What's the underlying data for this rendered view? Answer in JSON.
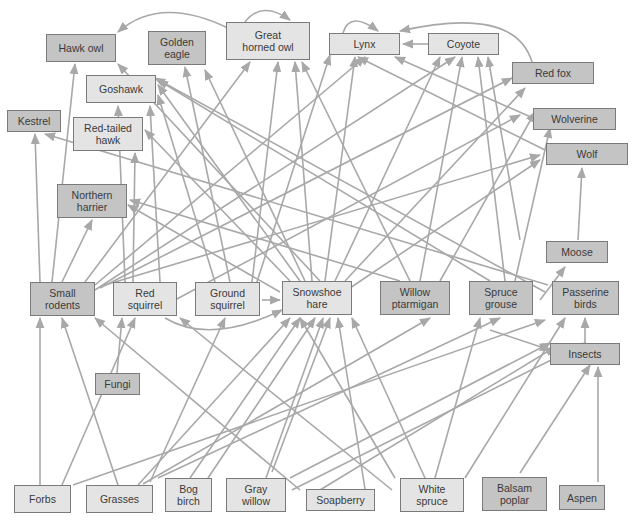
{
  "diagram": {
    "type": "food-web",
    "colors": {
      "light_box": "#e4e4e4",
      "dark_box": "#c4c4c4",
      "border": "#7a7a7a",
      "arrow": "#a8a8a8",
      "text": "#3a3a3a"
    },
    "nodes": [
      {
        "id": "hawk_owl",
        "label": "Hawk owl",
        "x": 46,
        "y": 34,
        "w": 70,
        "h": 28,
        "shade": "dark"
      },
      {
        "id": "golden_eagle",
        "label": "Golden\neagle",
        "x": 148,
        "y": 31,
        "w": 58,
        "h": 34,
        "shade": "dark"
      },
      {
        "id": "great_horned_owl",
        "label": "Great\nhorned owl",
        "x": 226,
        "y": 22,
        "w": 84,
        "h": 38,
        "shade": "light"
      },
      {
        "id": "lynx",
        "label": "Lynx",
        "x": 329,
        "y": 33,
        "w": 71,
        "h": 22,
        "shade": "light"
      },
      {
        "id": "coyote",
        "label": "Coyote",
        "x": 428,
        "y": 33,
        "w": 71,
        "h": 22,
        "shade": "light"
      },
      {
        "id": "red_fox",
        "label": "Red fox",
        "x": 512,
        "y": 62,
        "w": 82,
        "h": 22,
        "shade": "dark"
      },
      {
        "id": "goshawk",
        "label": "Goshawk",
        "x": 86,
        "y": 75,
        "w": 70,
        "h": 28,
        "shade": "light"
      },
      {
        "id": "kestrel",
        "label": "Kestrel",
        "x": 7,
        "y": 110,
        "w": 54,
        "h": 22,
        "shade": "dark"
      },
      {
        "id": "red_tailed_hawk",
        "label": "Red-tailed\nhawk",
        "x": 73,
        "y": 117,
        "w": 70,
        "h": 34,
        "shade": "light"
      },
      {
        "id": "wolverine",
        "label": "Wolverine",
        "x": 533,
        "y": 108,
        "w": 83,
        "h": 22,
        "shade": "dark"
      },
      {
        "id": "wolf",
        "label": "Wolf",
        "x": 546,
        "y": 143,
        "w": 82,
        "h": 22,
        "shade": "dark"
      },
      {
        "id": "northern_harrier",
        "label": "Northern\nharrier",
        "x": 57,
        "y": 184,
        "w": 70,
        "h": 34,
        "shade": "dark"
      },
      {
        "id": "moose",
        "label": "Moose",
        "x": 546,
        "y": 241,
        "w": 62,
        "h": 22,
        "shade": "dark"
      },
      {
        "id": "small_rodents",
        "label": "Small\nrodents",
        "x": 30,
        "y": 282,
        "w": 65,
        "h": 34,
        "shade": "dark"
      },
      {
        "id": "red_squirrel",
        "label": "Red\nsquirrel",
        "x": 113,
        "y": 282,
        "w": 64,
        "h": 34,
        "shade": "light"
      },
      {
        "id": "ground_squirrel",
        "label": "Ground\nsquirrel",
        "x": 195,
        "y": 282,
        "w": 65,
        "h": 34,
        "shade": "light"
      },
      {
        "id": "snowshoe_hare",
        "label": "Snowshoe\nhare",
        "x": 282,
        "y": 281,
        "w": 70,
        "h": 34,
        "shade": "light"
      },
      {
        "id": "willow_ptarmigan",
        "label": "Willow\nptarmigan",
        "x": 380,
        "y": 281,
        "w": 70,
        "h": 34,
        "shade": "dark"
      },
      {
        "id": "spruce_grouse",
        "label": "Spruce\ngrouse",
        "x": 469,
        "y": 281,
        "w": 64,
        "h": 34,
        "shade": "dark"
      },
      {
        "id": "passerine_birds",
        "label": "Passerine\nbirds",
        "x": 552,
        "y": 281,
        "w": 67,
        "h": 34,
        "shade": "dark"
      },
      {
        "id": "insects",
        "label": "Insects",
        "x": 550,
        "y": 343,
        "w": 70,
        "h": 22,
        "shade": "dark"
      },
      {
        "id": "fungi",
        "label": "Fungi",
        "x": 95,
        "y": 373,
        "w": 45,
        "h": 22,
        "shade": "dark"
      },
      {
        "id": "forbs",
        "label": "Forbs",
        "x": 14,
        "y": 485,
        "w": 57,
        "h": 28,
        "shade": "light"
      },
      {
        "id": "grasses",
        "label": "Grasses",
        "x": 86,
        "y": 485,
        "w": 67,
        "h": 28,
        "shade": "light"
      },
      {
        "id": "bog_birch",
        "label": "Bog\nbirch",
        "x": 165,
        "y": 478,
        "w": 47,
        "h": 34,
        "shade": "light"
      },
      {
        "id": "gray_willow",
        "label": "Gray\nwillow",
        "x": 226,
        "y": 478,
        "w": 60,
        "h": 34,
        "shade": "light"
      },
      {
        "id": "soapberry",
        "label": "Soapberry",
        "x": 306,
        "y": 489,
        "w": 69,
        "h": 22,
        "shade": "light"
      },
      {
        "id": "white_spruce",
        "label": "White\nspruce",
        "x": 400,
        "y": 478,
        "w": 64,
        "h": 34,
        "shade": "light"
      },
      {
        "id": "balsam_poplar",
        "label": "Balsam\npoplar",
        "x": 482,
        "y": 477,
        "w": 65,
        "h": 34,
        "shade": "dark"
      },
      {
        "id": "aspen",
        "label": "Aspen",
        "x": 559,
        "y": 485,
        "w": 46,
        "h": 25,
        "shade": "dark"
      }
    ],
    "edges": [
      {
        "x1": 40,
        "y1": 485,
        "x2": 40,
        "y2": 318
      },
      {
        "x1": 118,
        "y1": 485,
        "x2": 62,
        "y2": 318
      },
      {
        "x1": 62,
        "y1": 485,
        "x2": 135,
        "y2": 318
      },
      {
        "x1": 138,
        "y1": 485,
        "x2": 290,
        "y2": 318
      },
      {
        "x1": 73,
        "y1": 485,
        "x2": 545,
        "y2": 320
      },
      {
        "x1": 190,
        "y1": 478,
        "x2": 300,
        "y2": 318
      },
      {
        "x1": 208,
        "y1": 478,
        "x2": 315,
        "y2": 318
      },
      {
        "x1": 150,
        "y1": 482,
        "x2": 225,
        "y2": 318
      },
      {
        "x1": 143,
        "y1": 484,
        "x2": 430,
        "y2": 318
      },
      {
        "x1": 158,
        "y1": 478,
        "x2": 500,
        "y2": 318
      },
      {
        "x1": 272,
        "y1": 472,
        "x2": 330,
        "y2": 318
      },
      {
        "x1": 290,
        "y1": 478,
        "x2": 550,
        "y2": 343
      },
      {
        "x1": 292,
        "y1": 490,
        "x2": 585,
        "y2": 343
      },
      {
        "x1": 266,
        "y1": 478,
        "x2": 323,
        "y2": 318
      },
      {
        "x1": 365,
        "y1": 489,
        "x2": 338,
        "y2": 318
      },
      {
        "x1": 300,
        "y1": 490,
        "x2": 95,
        "y2": 318
      },
      {
        "x1": 395,
        "y1": 478,
        "x2": 300,
        "y2": 318
      },
      {
        "x1": 425,
        "y1": 478,
        "x2": 352,
        "y2": 318
      },
      {
        "x1": 392,
        "y1": 490,
        "x2": 180,
        "y2": 318
      },
      {
        "x1": 435,
        "y1": 478,
        "x2": 480,
        "y2": 318
      },
      {
        "x1": 465,
        "y1": 478,
        "x2": 565,
        "y2": 318
      },
      {
        "x1": 320,
        "y1": 490,
        "x2": 555,
        "y2": 347
      },
      {
        "x1": 520,
        "y1": 473,
        "x2": 590,
        "y2": 365
      },
      {
        "x1": 598,
        "y1": 482,
        "x2": 598,
        "y2": 367
      },
      {
        "x1": 117,
        "y1": 373,
        "x2": 122,
        "y2": 318
      },
      {
        "x1": 585,
        "y1": 343,
        "x2": 585,
        "y2": 318
      },
      {
        "x1": 540,
        "y1": 300,
        "x2": 565,
        "y2": 267
      },
      {
        "x1": 578,
        "y1": 240,
        "x2": 582,
        "y2": 168
      },
      {
        "x1": 40,
        "y1": 282,
        "x2": 35,
        "y2": 134
      },
      {
        "x1": 52,
        "y1": 282,
        "x2": 75,
        "y2": 64
      },
      {
        "x1": 62,
        "y1": 282,
        "x2": 92,
        "y2": 220
      },
      {
        "x1": 85,
        "y1": 282,
        "x2": 250,
        "y2": 62
      },
      {
        "x1": 95,
        "y1": 285,
        "x2": 365,
        "y2": 57
      },
      {
        "x1": 95,
        "y1": 290,
        "x2": 455,
        "y2": 57
      },
      {
        "x1": 100,
        "y1": 288,
        "x2": 512,
        "y2": 78
      },
      {
        "x1": 105,
        "y1": 285,
        "x2": 540,
        "y2": 155
      },
      {
        "x1": 125,
        "y1": 282,
        "x2": 118,
        "y2": 106
      },
      {
        "x1": 160,
        "y1": 282,
        "x2": 150,
        "y2": 106
      },
      {
        "x1": 133,
        "y1": 282,
        "x2": 135,
        "y2": 153
      },
      {
        "x1": 175,
        "y1": 300,
        "x2": 520,
        "y2": 115
      },
      {
        "x1": 215,
        "y1": 282,
        "x2": 158,
        "y2": 95
      },
      {
        "x1": 230,
        "y1": 282,
        "x2": 185,
        "y2": 67
      },
      {
        "x1": 252,
        "y1": 282,
        "x2": 278,
        "y2": 62
      },
      {
        "x1": 255,
        "y1": 288,
        "x2": 330,
        "y2": 55
      },
      {
        "x1": 262,
        "y1": 300,
        "x2": 280,
        "y2": 300
      },
      {
        "x1": 280,
        "y1": 292,
        "x2": 128,
        "y2": 205
      },
      {
        "x1": 290,
        "y1": 281,
        "x2": 145,
        "y2": 130
      },
      {
        "x1": 300,
        "y1": 281,
        "x2": 158,
        "y2": 85
      },
      {
        "x1": 305,
        "y1": 281,
        "x2": 205,
        "y2": 70
      },
      {
        "x1": 312,
        "y1": 281,
        "x2": 295,
        "y2": 62
      },
      {
        "x1": 325,
        "y1": 281,
        "x2": 355,
        "y2": 57
      },
      {
        "x1": 335,
        "y1": 281,
        "x2": 440,
        "y2": 57
      },
      {
        "x1": 345,
        "y1": 281,
        "x2": 525,
        "y2": 88
      },
      {
        "x1": 350,
        "y1": 288,
        "x2": 540,
        "y2": 160
      },
      {
        "x1": 320,
        "y1": 281,
        "x2": 118,
        "y2": 64
      },
      {
        "x1": 410,
        "y1": 281,
        "x2": 302,
        "y2": 62
      },
      {
        "x1": 400,
        "y1": 281,
        "x2": 130,
        "y2": 200
      },
      {
        "x1": 420,
        "y1": 281,
        "x2": 462,
        "y2": 57
      },
      {
        "x1": 440,
        "y1": 281,
        "x2": 535,
        "y2": 112
      },
      {
        "x1": 490,
        "y1": 281,
        "x2": 158,
        "y2": 80
      },
      {
        "x1": 505,
        "y1": 281,
        "x2": 478,
        "y2": 57
      },
      {
        "x1": 515,
        "y1": 281,
        "x2": 550,
        "y2": 128
      },
      {
        "x1": 548,
        "y1": 285,
        "x2": 45,
        "y2": 134
      },
      {
        "x1": 545,
        "y1": 292,
        "x2": 155,
        "y2": 78
      },
      {
        "x1": 520,
        "y1": 240,
        "x2": 488,
        "y2": 57
      },
      {
        "x1": 545,
        "y1": 150,
        "x2": 358,
        "y2": 57
      },
      {
        "x1": 533,
        "y1": 118,
        "x2": 395,
        "y2": 57
      },
      {
        "x1": 490,
        "y1": 330,
        "x2": 550,
        "y2": 350
      }
    ],
    "curves": [
      {
        "d": "M 228 28 Q 160 -5 118 32"
      },
      {
        "d": "M 245 22 Q 262 0 290 20"
      },
      {
        "d": "M 343 33 Q 350 10 378 31"
      },
      {
        "d": "M 428 44 L 403 44"
      },
      {
        "d": "M 532 62 Q 515 5 400 31"
      },
      {
        "d": "M 165 318 Q 210 345 282 310"
      }
    ]
  }
}
